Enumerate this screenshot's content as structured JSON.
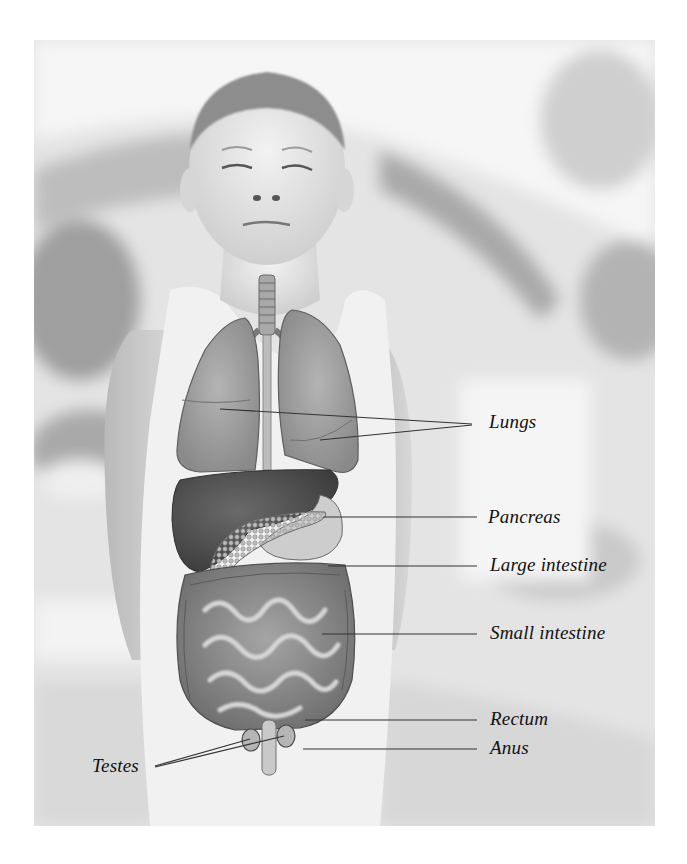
{
  "figure": {
    "colors": {
      "background": "#ffffff",
      "photo_base": "#e6e6e6",
      "label_text": "#111111",
      "leader_line": "#333333"
    }
  },
  "labels": [
    {
      "id": "lungs",
      "text": "Lungs",
      "x": 489,
      "y": 412
    },
    {
      "id": "pancreas",
      "text": "Pancreas",
      "x": 488,
      "y": 507
    },
    {
      "id": "large-intestine",
      "text": "Large intestine",
      "x": 490,
      "y": 555
    },
    {
      "id": "small-intestine",
      "text": "Small intestine",
      "x": 490,
      "y": 623
    },
    {
      "id": "rectum",
      "text": "Rectum",
      "x": 490,
      "y": 709
    },
    {
      "id": "anus",
      "text": "Anus",
      "x": 490,
      "y": 738
    },
    {
      "id": "testes",
      "text": "Testes",
      "x": 92,
      "y": 756
    }
  ],
  "leader_lines": [
    {
      "label": "lungs",
      "x1": 472,
      "y1": 424,
      "x2": 220,
      "y2": 409
    },
    {
      "label": "lungs",
      "x1": 472,
      "y1": 425,
      "x2": 320,
      "y2": 440
    },
    {
      "label": "pancreas",
      "x1": 477,
      "y1": 517,
      "x2": 323,
      "y2": 517
    },
    {
      "label": "large-intestine",
      "x1": 477,
      "y1": 566,
      "x2": 328,
      "y2": 566
    },
    {
      "label": "small-intestine",
      "x1": 477,
      "y1": 634,
      "x2": 322,
      "y2": 634
    },
    {
      "label": "rectum",
      "x1": 477,
      "y1": 720,
      "x2": 305,
      "y2": 720
    },
    {
      "label": "anus",
      "x1": 477,
      "y1": 749,
      "x2": 303,
      "y2": 749
    },
    {
      "label": "testes",
      "x1": 155,
      "y1": 766,
      "x2": 250,
      "y2": 739
    },
    {
      "label": "testes",
      "x1": 155,
      "y1": 767,
      "x2": 284,
      "y2": 736
    }
  ]
}
